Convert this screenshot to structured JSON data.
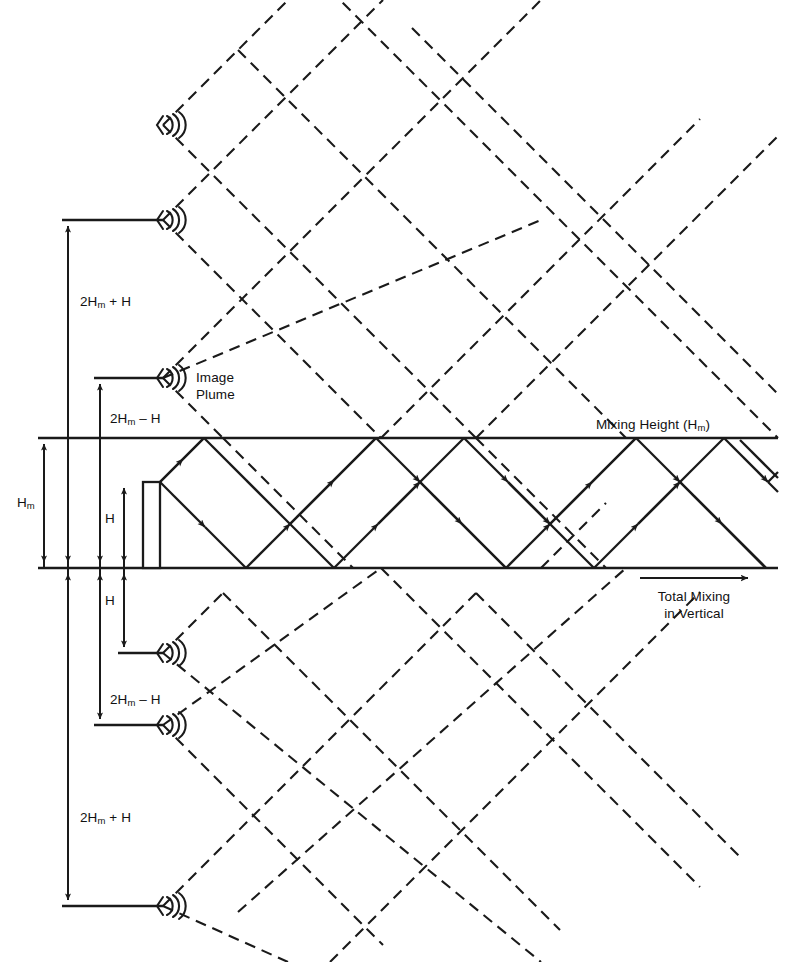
{
  "figure": {
    "kind": "plume-reflection-schematic",
    "background": "#ffffff",
    "ink": "#1a1a1a",
    "width": 792,
    "height": 962
  },
  "boundaries": {
    "mixing_height_line_y": 438,
    "ground_line_y": 568,
    "line_x_start": 38,
    "line_x_end": 778
  },
  "labels": {
    "mixing_height": "Mixing Height (H",
    "mixing_height_sub": "m",
    "mixing_height_close": ")",
    "image_plume_line1": "Image",
    "image_plume_line2": "Plume",
    "total_mixing_line1": "Total Mixing",
    "total_mixing_line2": "in Vertical",
    "two_hm_plus_h_pre": "2H",
    "two_hm_plus_h_sub": "m",
    "two_hm_plus_h_post": " + H",
    "two_hm_minus_h_pre": "2H",
    "two_hm_minus_h_sub": "m",
    "two_hm_minus_h_post": " – H",
    "hm_pre": "H",
    "hm_sub": "m",
    "h": "H"
  },
  "dimensions": [
    {
      "name": "2Hm+H-upper",
      "x": 68,
      "y1": 220,
      "y2": 568,
      "label": "2Hₙ + H"
    },
    {
      "name": "2Hm-H-upper",
      "x": 100,
      "y1": 378,
      "y2": 568,
      "label": "2Hₙ – H"
    },
    {
      "name": "Hm",
      "x": 44,
      "y1": 438,
      "y2": 568,
      "label": "Hₙ"
    },
    {
      "name": "H-above",
      "x": 124,
      "y1": 482,
      "y2": 568,
      "label": "H"
    },
    {
      "name": "H-below",
      "x": 124,
      "y1": 568,
      "y2": 653,
      "label": "H"
    },
    {
      "name": "2Hm-H-lower",
      "x": 100,
      "y1": 568,
      "y2": 725,
      "label": "2Hₙ – H"
    },
    {
      "name": "2Hm+H-lower",
      "x": 68,
      "y1": 568,
      "y2": 906,
      "label": "2Hₙ + H"
    }
  ],
  "sources": [
    {
      "name": "image-source-top",
      "x": 163,
      "y": 125,
      "leader": false,
      "leader_x": 0
    },
    {
      "name": "image-source-upper",
      "x": 163,
      "y": 220,
      "leader": true,
      "leader_x": 68
    },
    {
      "name": "image-source-near-above",
      "x": 163,
      "y": 378,
      "leader": true,
      "leader_x": 100
    },
    {
      "name": "real-stack",
      "x": 152,
      "y": 482,
      "leader": false,
      "leader_x": 0
    },
    {
      "name": "image-source-near-below",
      "x": 163,
      "y": 653,
      "leader": true,
      "leader_x": 124
    },
    {
      "name": "image-source-lower",
      "x": 163,
      "y": 725,
      "leader": true,
      "leader_x": 100
    },
    {
      "name": "image-source-bottom",
      "x": 163,
      "y": 906,
      "leader": true,
      "leader_x": 68
    }
  ],
  "stack": {
    "x_left": 143,
    "x_right": 160,
    "top_y": 482,
    "base_y": 568
  },
  "arrow_annotation": {
    "name": "total-mixing-arrow",
    "x1": 640,
    "x2": 752,
    "y": 578
  },
  "legend_note": "Solid rays = real plume reflecting between ground and mixing height; dashed rays = image plumes"
}
